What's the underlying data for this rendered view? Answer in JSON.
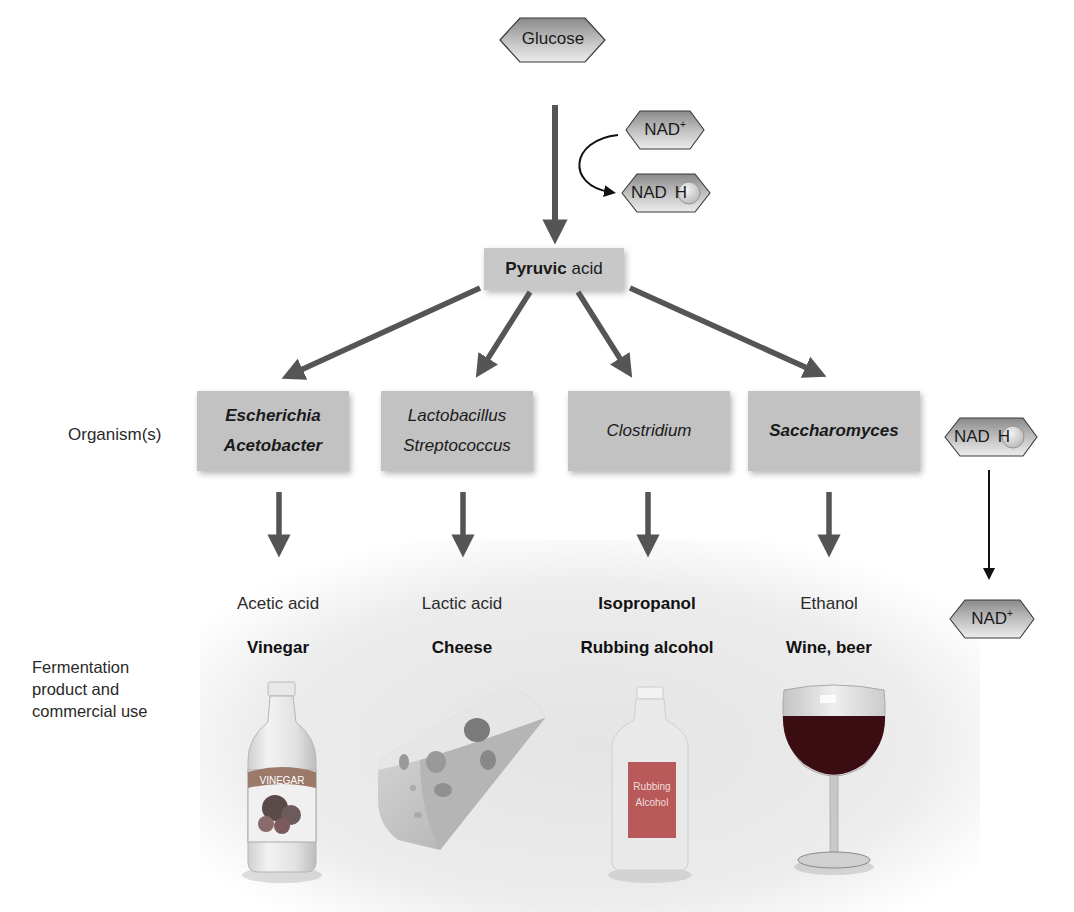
{
  "start": {
    "molecule": "Glucose"
  },
  "cofactor_glycolysis": {
    "in": "NAD+",
    "in_base": "NAD",
    "in_sup": "+",
    "out": "NADH",
    "out_base": "NAD",
    "out_h": "H"
  },
  "intermediate": {
    "bold": "Pyruvic",
    "rest": " acid"
  },
  "rows": {
    "organisms_label": "Organism(s)",
    "products_label_lines": [
      "Fermentation",
      "product and",
      "commercial use"
    ]
  },
  "branches": [
    {
      "organisms": [
        "Escherichia",
        "Acetobacter"
      ],
      "organisms_bold": true,
      "product": "Acetic acid",
      "product_bold": false,
      "use": "Vinegar",
      "image": "vinegar-bottle",
      "image_label": "VINEGAR"
    },
    {
      "organisms": [
        "Lactobacillus",
        "Streptococcus"
      ],
      "organisms_bold": false,
      "product": "Lactic acid",
      "product_bold": false,
      "use": "Cheese",
      "image": "swiss-cheese-wedge"
    },
    {
      "organisms": [
        "Clostridium"
      ],
      "organisms_bold": false,
      "product": "Isopropanol",
      "product_bold": true,
      "use": "Rubbing alcohol",
      "image": "rubbing-alcohol-bottle",
      "image_label_lines": [
        "Rubbing",
        "Alcohol"
      ]
    },
    {
      "organisms": [
        "Saccharomyces"
      ],
      "organisms_bold": true,
      "product": "Ethanol",
      "product_bold": false,
      "use": "Wine, beer",
      "image": "wine-glass"
    }
  ],
  "cofactor_fermentation": {
    "in": "NADH",
    "in_base": "NAD",
    "in_h": "H",
    "out": "NAD+",
    "out_base": "NAD",
    "out_sup": "+"
  },
  "colors": {
    "arrow": "#555555",
    "box": "#c2c2c2",
    "hex_dark": "#8c8c8c",
    "hex_light": "#e6e6e6",
    "wine": "#3a0d12",
    "label_red": "#b84a4a"
  }
}
